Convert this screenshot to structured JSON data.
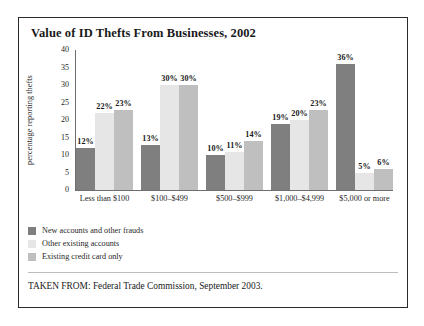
{
  "figure": {
    "title": "Value of ID Thefts From Businesses, 2002",
    "source_note": "TAKEN FROM: Federal Trade Commission, September 2003."
  },
  "chart_data": {
    "type": "bar",
    "title": "Value of ID Thefts From Businesses, 2002",
    "xlabel": "",
    "ylabel": "percentage reporting thefts",
    "ylim": [
      0,
      40
    ],
    "yticks": [
      0,
      5,
      10,
      15,
      20,
      25,
      30,
      35,
      40
    ],
    "grid": false,
    "legend_position": "below-plot-left",
    "categories": [
      "Less than $100",
      "$100–$499",
      "$500–$999",
      "$1,000–$4,999",
      "$5,000 or more"
    ],
    "series": [
      {
        "name": "New accounts and other frauds",
        "color": "#7f7f7f",
        "values": [
          12,
          13,
          10,
          19,
          36
        ],
        "labels": [
          "12%",
          "13%",
          "10%",
          "19%",
          "36%"
        ]
      },
      {
        "name": "Other existing accounts",
        "color": "#e6e6e6",
        "values": [
          22,
          30,
          11,
          20,
          5
        ],
        "labels": [
          "22%",
          "30%",
          "11%",
          "20%",
          "5%"
        ]
      },
      {
        "name": "Existing credit card only",
        "color": "#bfbfbf",
        "values": [
          23,
          30,
          14,
          23,
          6
        ],
        "labels": [
          "23%",
          "30%",
          "14%",
          "23%",
          "6%"
        ]
      }
    ]
  }
}
